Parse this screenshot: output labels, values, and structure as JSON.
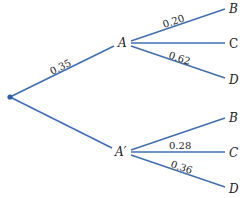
{
  "diagram": {
    "type": "probability-tree",
    "line_color": "#3f6fb0",
    "root": {
      "x": 10,
      "y": 97
    },
    "nodes": {
      "A": {
        "label": "A",
        "x": 122,
        "y": 43
      },
      "A_prime": {
        "label": "A′",
        "x": 123,
        "y": 152
      },
      "A_B": {
        "label": "B",
        "x": 232,
        "y": 9
      },
      "A_C": {
        "label": "C",
        "x": 233,
        "y": 43
      },
      "A_D": {
        "label": "D",
        "x": 233,
        "y": 79
      },
      "Ap_B": {
        "label": "B",
        "x": 232,
        "y": 118
      },
      "Ap_C": {
        "label": "C",
        "x": 233,
        "y": 152
      },
      "Ap_D": {
        "label": "D",
        "x": 233,
        "y": 188
      }
    },
    "edges": {
      "root_A": {
        "from": "root",
        "to": "A",
        "probability": "0.35"
      },
      "root_Ap": {
        "from": "root",
        "to": "A′",
        "probability": ""
      },
      "A_B": {
        "from": "A",
        "to": "B",
        "probability": "0.20"
      },
      "A_C": {
        "from": "A",
        "to": "C",
        "probability": ""
      },
      "A_D": {
        "from": "A",
        "to": "D",
        "probability": "0.62"
      },
      "Ap_B": {
        "from": "A′",
        "to": "B",
        "probability": ""
      },
      "Ap_C": {
        "from": "A′",
        "to": "C",
        "probability": "0.28"
      },
      "Ap_D": {
        "from": "A′",
        "to": "D",
        "probability": "0.36"
      }
    }
  }
}
